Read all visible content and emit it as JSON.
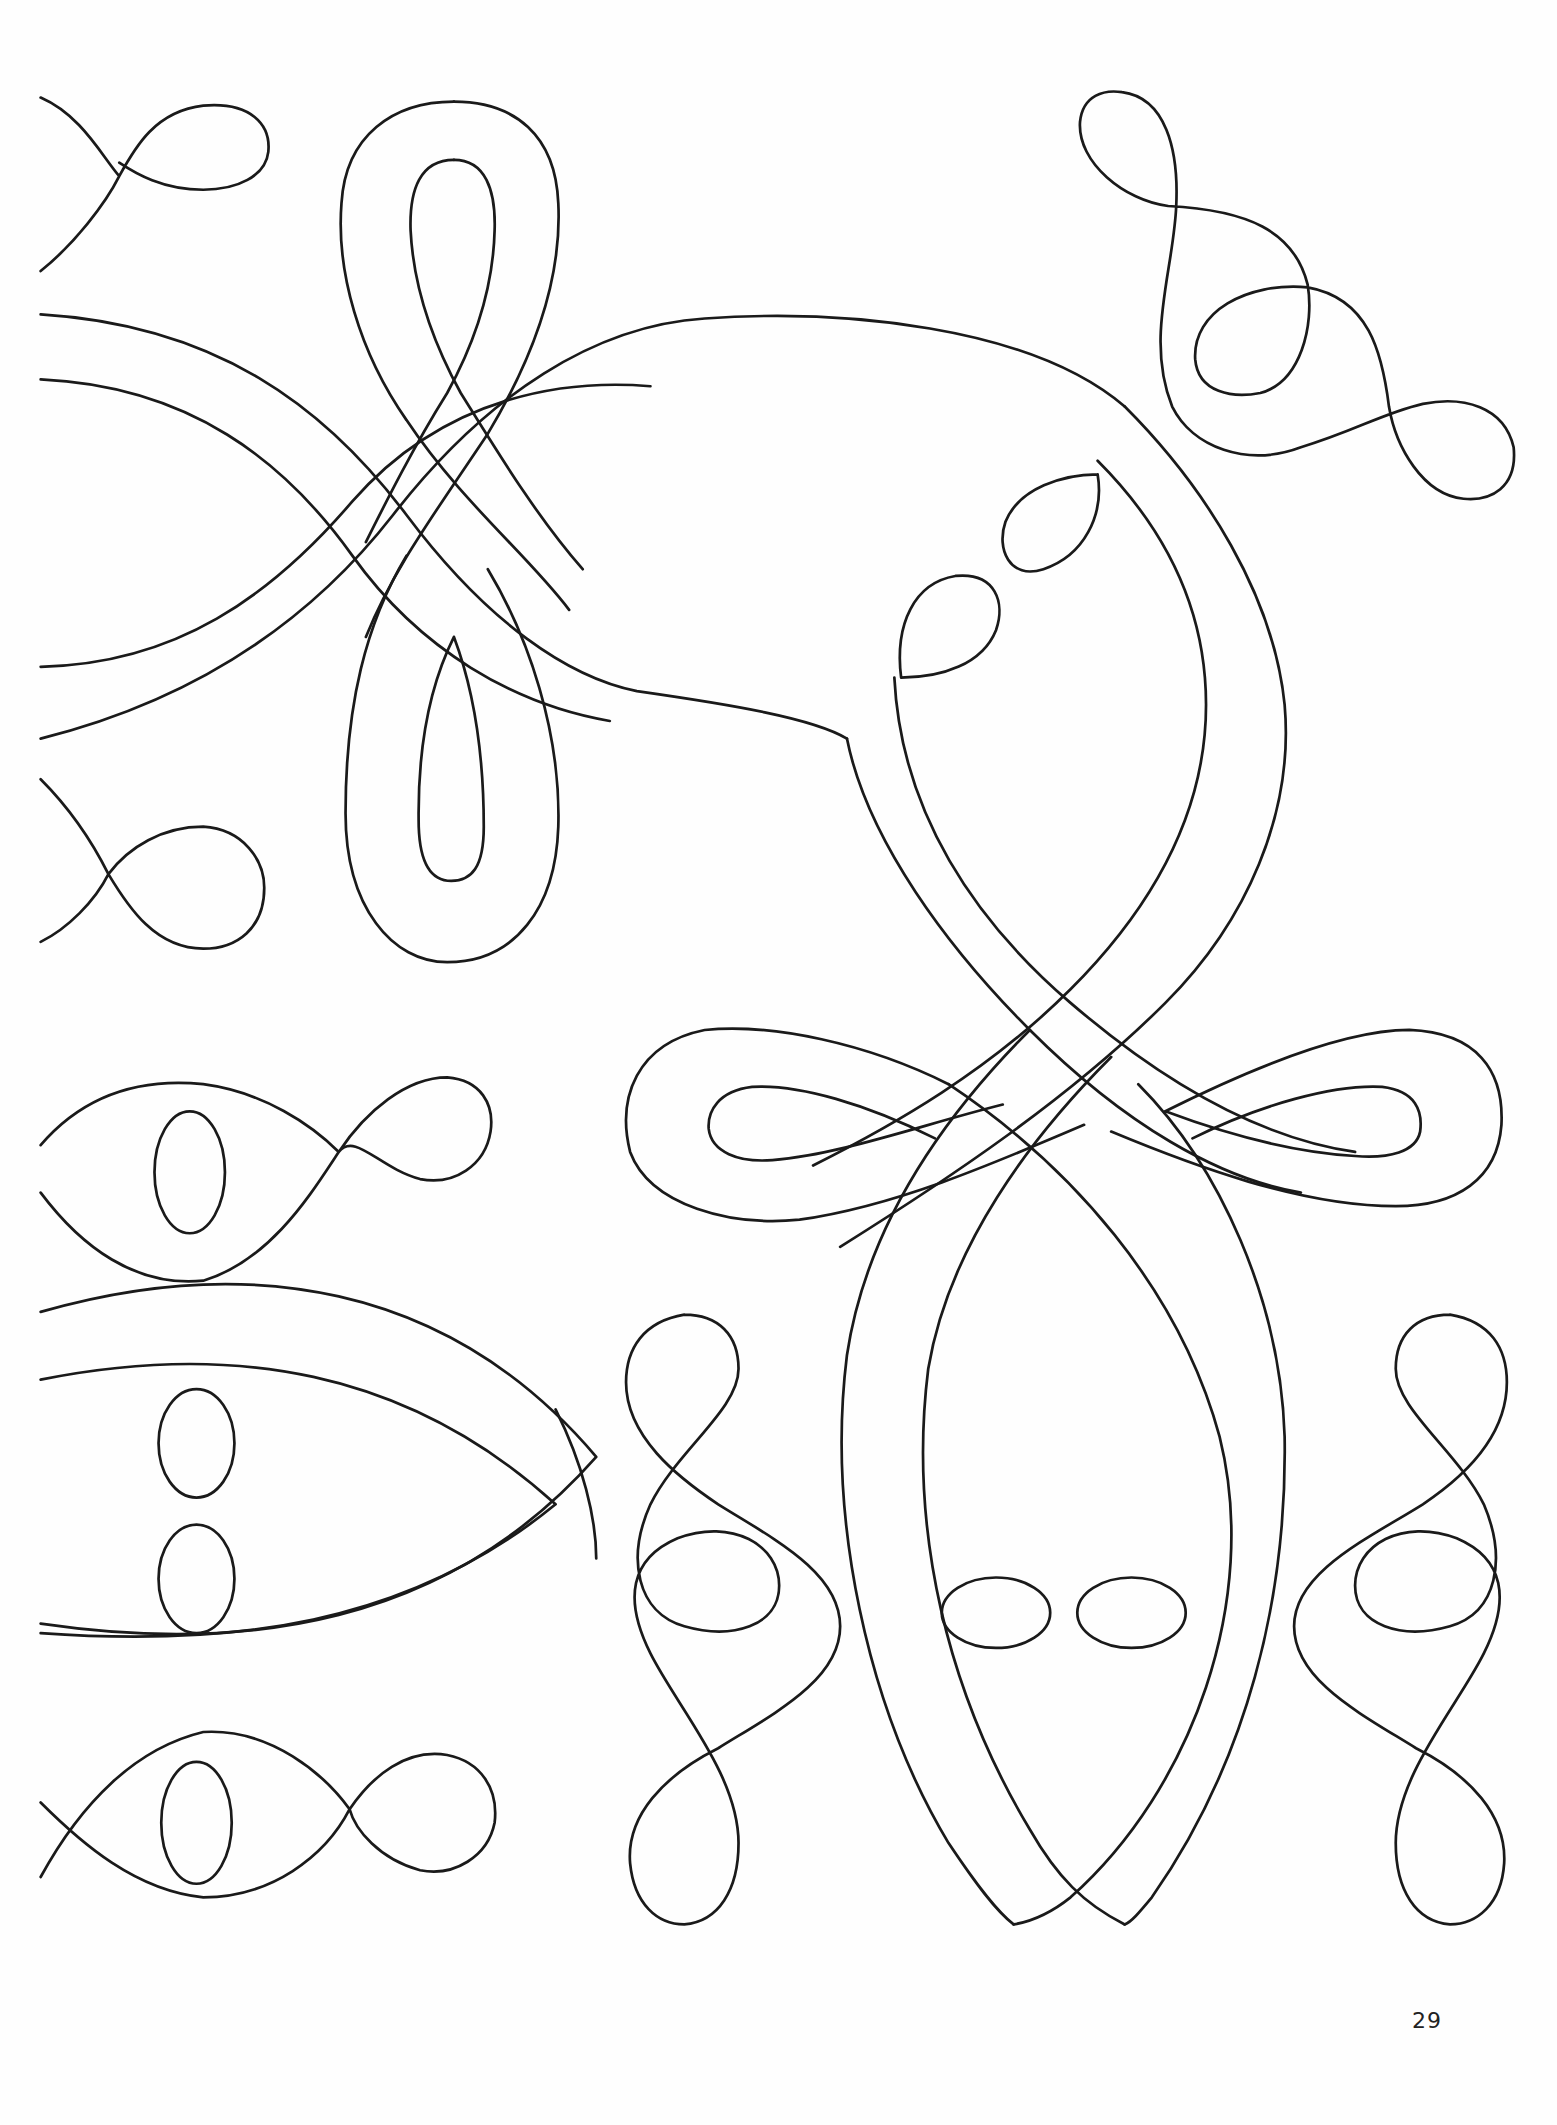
{
  "page": {
    "type": "coloring-book-page",
    "page_number": "29",
    "colors": {
      "background": "#fefefe",
      "ink": "#1a1a1a"
    }
  }
}
